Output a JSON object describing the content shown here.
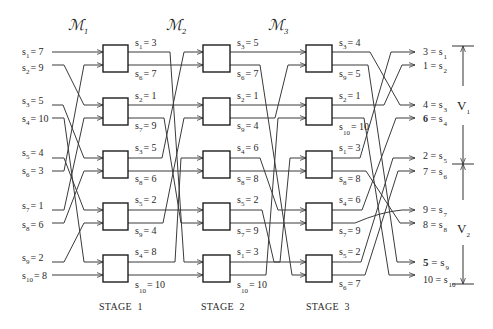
{
  "modules": [
    {
      "symbol": "ℳ",
      "sub": "1"
    },
    {
      "symbol": "ℳ",
      "sub": "2"
    },
    {
      "symbol": "ℳ",
      "sub": "3"
    }
  ],
  "inputs": [
    {
      "var": "s",
      "sub": "1",
      "eq": "= 7"
    },
    {
      "var": "s",
      "sub": "2",
      "eq": "= 9"
    },
    {
      "var": "s",
      "sub": "3",
      "eq": "= 5"
    },
    {
      "var": "s",
      "sub": "4",
      "eq": "= 10"
    },
    {
      "var": "s",
      "sub": "5",
      "eq": "= 4"
    },
    {
      "var": "s",
      "sub": "6",
      "eq": "= 3"
    },
    {
      "var": "s",
      "sub": "7",
      "eq": "= 1"
    },
    {
      "var": "s",
      "sub": "8",
      "eq": "= 6"
    },
    {
      "var": "s",
      "sub": "9",
      "eq": "= 2"
    },
    {
      "var": "s",
      "sub": "10",
      "eq": "= 8"
    }
  ],
  "stages": [
    {
      "label": "STAGE  1",
      "boxes": [
        {
          "top": {
            "var": "s",
            "sub": "1",
            "eq": "= 3"
          },
          "bottom": {
            "var": "s",
            "sub": "6",
            "eq": "= 7"
          }
        },
        {
          "top": {
            "var": "s",
            "sub": "2",
            "eq": "= 1"
          },
          "bottom": {
            "var": "s",
            "sub": "7",
            "eq": "= 9"
          }
        },
        {
          "top": {
            "var": "s",
            "sub": "3",
            "eq": "= 5"
          },
          "bottom": {
            "var": "s",
            "sub": "8",
            "eq": "= 6"
          }
        },
        {
          "top": {
            "var": "s",
            "sub": "5",
            "eq": "= 2"
          },
          "bottom": {
            "var": "s",
            "sub": "9",
            "eq": "= 4"
          }
        },
        {
          "top": {
            "var": "s",
            "sub": "4",
            "eq": "= 8"
          },
          "bottom": {
            "var": "s",
            "sub": "10",
            "eq": "= 10"
          }
        }
      ]
    },
    {
      "label": "STAGE  2",
      "boxes": [
        {
          "top": {
            "var": "s",
            "sub": "3",
            "eq": "= 5"
          },
          "bottom": {
            "var": "s",
            "sub": "6",
            "eq": "= 7"
          }
        },
        {
          "top": {
            "var": "s",
            "sub": "2",
            "eq": "= 1"
          },
          "bottom": {
            "var": "s",
            "sub": "9",
            "eq": "= 4"
          }
        },
        {
          "top": {
            "var": "s",
            "sub": "4",
            "eq": "= 6"
          },
          "bottom": {
            "var": "s",
            "sub": "8",
            "eq": "= 8"
          }
        },
        {
          "top": {
            "var": "s",
            "sub": "5",
            "eq": "= 2"
          },
          "bottom": {
            "var": "s",
            "sub": "7",
            "eq": "= 9"
          }
        },
        {
          "top": {
            "var": "s",
            "sub": "1",
            "eq": "= 3"
          },
          "bottom": {
            "var": "s",
            "sub": "10",
            "eq": "= 10"
          }
        }
      ]
    },
    {
      "label": "STAGE  3",
      "boxes": [
        {
          "top": {
            "var": "s",
            "sub": "3",
            "eq": "= 4"
          },
          "bottom": {
            "var": "s",
            "sub": "9",
            "eq": "= 5"
          }
        },
        {
          "top": {
            "var": "s",
            "sub": "2",
            "eq": "= 1"
          },
          "bottom": {
            "var": "s",
            "sub": "10",
            "eq": "= 10"
          }
        },
        {
          "top": {
            "var": "s",
            "sub": "1",
            "eq": "= 3"
          },
          "bottom": {
            "var": "s",
            "sub": "8",
            "eq": "= 8"
          }
        },
        {
          "top": {
            "var": "s",
            "sub": "4",
            "eq": "= 6"
          },
          "bottom": {
            "var": "s",
            "sub": "7",
            "eq": "= 9"
          }
        },
        {
          "top": {
            "var": "s",
            "sub": "5",
            "eq": "= 2"
          },
          "bottom": {
            "var": "s",
            "sub": "6",
            "eq": "= 7"
          }
        }
      ]
    }
  ],
  "outputs": [
    {
      "val": "3",
      "eq": " = s",
      "sub": "1",
      "weight": "normal"
    },
    {
      "val": "1",
      "eq": " = s",
      "sub": "2",
      "weight": "normal"
    },
    {
      "val": "4",
      "eq": " = s",
      "sub": "3",
      "weight": "normal"
    },
    {
      "val": "6",
      "eq": " = s",
      "sub": "4",
      "weight": "bold"
    },
    {
      "val": "2",
      "eq": " = s",
      "sub": "5",
      "weight": "normal"
    },
    {
      "val": "7",
      "eq": " = s",
      "sub": "6",
      "weight": "normal"
    },
    {
      "val": "9",
      "eq": " = s",
      "sub": "7",
      "weight": "normal"
    },
    {
      "val": "8",
      "eq": " = s",
      "sub": "8",
      "weight": "normal"
    },
    {
      "val": "5",
      "eq": " = s",
      "sub": "9",
      "weight": "bold"
    },
    {
      "val": "10",
      "eq": " = s",
      "sub": "10",
      "weight": "normal"
    }
  ],
  "groups": [
    {
      "label": "V",
      "sub": "1"
    },
    {
      "label": "V",
      "sub": "2"
    }
  ]
}
